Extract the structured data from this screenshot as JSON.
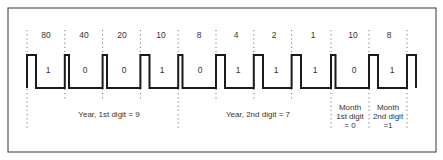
{
  "diagram": {
    "weights": [
      "80",
      "40",
      "20",
      "10",
      "8",
      "4",
      "2",
      "1",
      "10",
      "8"
    ],
    "bits": [
      "1",
      "0",
      "0",
      "1",
      "0",
      "1",
      "1",
      "1",
      "0",
      "1"
    ],
    "groups": [
      {
        "lines": [
          "Year, 1st digit = 9"
        ]
      },
      {
        "lines": [
          "Year, 2nd digit = 7"
        ]
      },
      {
        "lines": [
          "Month",
          "1st digit",
          "= 0"
        ]
      },
      {
        "lines": [
          "Month",
          "2nd digit",
          "=1"
        ]
      }
    ],
    "colors": {
      "frame": "#555555",
      "waveform": "#1a1a1a",
      "dotted": "#777777",
      "text": "#333333"
    }
  }
}
